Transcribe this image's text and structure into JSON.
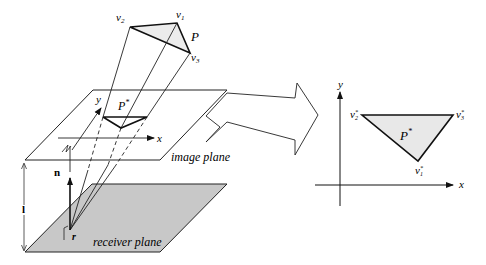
{
  "left_figure": {
    "polygon_label": "P",
    "vertex_labels": {
      "v1": "v",
      "v1_sub": "1",
      "v2": "v",
      "v2_sub": "2",
      "v3": "v",
      "v3_sub": "3"
    },
    "projection_label": "P",
    "projection_sup": "*",
    "axis_x": "x",
    "axis_y": "y",
    "image_plane_label": "image plane",
    "receiver_plane_label": "receiver plane",
    "normal_label": "n",
    "distance_label": "l",
    "point_label": "r"
  },
  "right_figure": {
    "axis_x": "x",
    "axis_y": "y",
    "triangle_label": "P",
    "triangle_sup": "*",
    "v1": "v",
    "v1_sub": "1",
    "v1_sup": "*",
    "v2": "v",
    "v2_sub": "2",
    "v2_sup": "*",
    "v3": "v",
    "v3_sub": "3",
    "v3_sup": "*"
  },
  "colors": {
    "line": "#222222",
    "receiver_fill": "#c8c8c8",
    "triangle_fill": "#e8e8e8"
  }
}
